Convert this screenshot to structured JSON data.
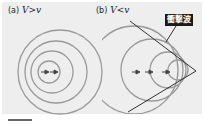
{
  "panels": [
    {
      "id": "a",
      "prefix": "(a)",
      "var_left": "V",
      "relation": ">",
      "var_right": "v",
      "circles": [
        {
          "cx": 60,
          "cy": 70,
          "r": 42
        },
        {
          "cx": 56,
          "cy": 70,
          "r": 32
        },
        {
          "cx": 52,
          "cy": 70,
          "r": 22
        },
        {
          "cx": 48,
          "cy": 70,
          "r": 12
        }
      ],
      "arrows": [
        {
          "x1": 40,
          "x2": 48,
          "y": 70
        },
        {
          "x1": 48,
          "x2": 56,
          "y": 70
        }
      ]
    },
    {
      "id": "b",
      "prefix": "(b)",
      "var_left": "V",
      "relation": "<",
      "var_right": "v",
      "shock_label": "衝撃波",
      "circles": [
        {
          "cx": 135,
          "cy": 68,
          "r": 42
        },
        {
          "cx": 150,
          "cy": 68,
          "r": 30
        },
        {
          "cx": 166,
          "cy": 68,
          "r": 18
        },
        {
          "cx": 176,
          "cy": 68,
          "r": 10
        }
      ],
      "arrows": [
        {
          "x1": 130,
          "x2": 140,
          "y": 68
        },
        {
          "x1": 145,
          "x2": 155,
          "y": 68
        },
        {
          "x1": 160,
          "x2": 170,
          "y": 68
        }
      ],
      "apex": {
        "x": 196,
        "y": 68
      }
    }
  ],
  "colors": {
    "panel_bg": "#eeeeee",
    "circle": "#9a9a9a",
    "arrow": "#444444",
    "shock_line": "#333333"
  }
}
